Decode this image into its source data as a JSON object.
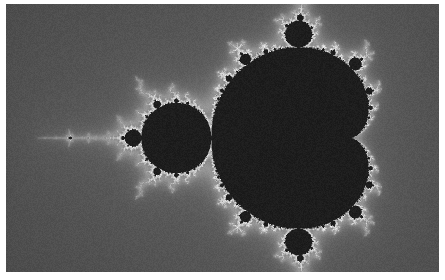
{
  "figure": {
    "kind": "mandelbrot-set-fractal",
    "colormap": "grayscale",
    "render_width": 433,
    "render_height": 268,
    "border_color": "#ffffff",
    "border_top": 4,
    "border_bottom": 8,
    "border_left": 6,
    "border_right": 6
  },
  "chart_data": {
    "type": "heatmap",
    "xlabel": "Re(c)",
    "ylabel": "Im(c)",
    "xlim": [
      -2.22,
      0.88
    ],
    "ylim": [
      -0.96,
      0.96
    ],
    "max_iterations": 180,
    "escape_radius": 2,
    "colormap": "grayscale",
    "interior_color": "#1d1d1d",
    "exterior_dark": "#232323",
    "exterior_bright": "#f2f2f2",
    "grid": false,
    "legend": null,
    "features": [
      {
        "name": "main-cardioid",
        "center_re": -0.25,
        "center_im": 0.0,
        "approx_px": [
          230,
          136
        ],
        "radius_px": 92
      },
      {
        "name": "period-2-bulb",
        "center_re": -1.0,
        "center_im": 0.0,
        "approx_px": [
          172,
          138
        ],
        "radius_px": 38
      },
      {
        "name": "upper-period-3-bulb",
        "center_re": -0.125,
        "center_im": 0.744,
        "approx_px": [
          258,
          60
        ],
        "radius_px": 14
      },
      {
        "name": "lower-period-3-bulb",
        "center_re": -0.125,
        "center_im": -0.744,
        "approx_px": [
          258,
          213
        ],
        "radius_px": 14
      },
      {
        "name": "period-4-mini-set",
        "center_re": -1.31,
        "center_im": 0.0,
        "approx_px": [
          133,
          138
        ],
        "radius_px": 6
      },
      {
        "name": "period-3-mini-set",
        "center_re": -1.75,
        "center_im": 0.0,
        "approx_px": [
          90,
          138
        ],
        "radius_px": 4
      },
      {
        "name": "needle-antenna",
        "center_re": -2.0,
        "center_im": 0.0,
        "approx_px": [
          57,
          138
        ],
        "radius_px": 1
      }
    ],
    "value_range": [
      0,
      180
    ]
  }
}
